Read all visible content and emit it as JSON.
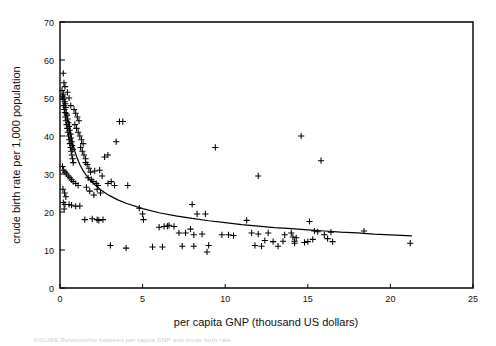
{
  "figure": {
    "caption_faint": "FIGURE  Relationship between per capita GNP and crude birth rate"
  },
  "chart_data": {
    "type": "scatter",
    "title": "",
    "xlabel": "per capita GNP (thousand US dollars)",
    "ylabel": "crude birth rate per 1,000 population",
    "xlim": [
      0,
      25
    ],
    "ylim": [
      0,
      70
    ],
    "xticks": [
      0,
      5,
      10,
      15,
      20,
      25
    ],
    "yticks": [
      0,
      10,
      20,
      30,
      40,
      50,
      60,
      70
    ],
    "xtick_labels": [
      "0",
      "5",
      "10",
      "15",
      "20",
      "25"
    ],
    "ytick_labels": [
      "0",
      "10",
      "20",
      "30",
      "40",
      "50",
      "60",
      "70"
    ],
    "grid": false,
    "legend": null,
    "marker": "plus",
    "marker_color": "#000000",
    "axis_color": "#000000",
    "series": [
      {
        "name": "countries",
        "marker": "+",
        "points": [
          [
            0.12,
            52.0
          ],
          [
            0.15,
            50.5
          ],
          [
            0.18,
            49.6
          ],
          [
            0.2,
            51.0
          ],
          [
            0.22,
            48.0
          ],
          [
            0.25,
            50.0
          ],
          [
            0.26,
            47.0
          ],
          [
            0.28,
            49.0
          ],
          [
            0.3,
            46.2
          ],
          [
            0.32,
            48.5
          ],
          [
            0.33,
            45.0
          ],
          [
            0.35,
            47.5
          ],
          [
            0.36,
            44.0
          ],
          [
            0.38,
            46.0
          ],
          [
            0.4,
            43.0
          ],
          [
            0.42,
            45.5
          ],
          [
            0.44,
            42.0
          ],
          [
            0.46,
            44.5
          ],
          [
            0.48,
            41.0
          ],
          [
            0.5,
            43.5
          ],
          [
            0.52,
            40.0
          ],
          [
            0.54,
            42.5
          ],
          [
            0.56,
            39.0
          ],
          [
            0.58,
            41.5
          ],
          [
            0.6,
            38.0
          ],
          [
            0.62,
            40.5
          ],
          [
            0.64,
            37.0
          ],
          [
            0.66,
            39.5
          ],
          [
            0.68,
            36.0
          ],
          [
            0.7,
            38.5
          ],
          [
            0.72,
            35.0
          ],
          [
            0.74,
            37.5
          ],
          [
            0.76,
            34.0
          ],
          [
            0.78,
            36.5
          ],
          [
            0.8,
            33.0
          ],
          [
            0.2,
            56.5
          ],
          [
            0.24,
            54.0
          ],
          [
            0.3,
            53.0
          ],
          [
            0.45,
            51.5
          ],
          [
            0.55,
            50.0
          ],
          [
            0.65,
            48.0
          ],
          [
            0.85,
            47.0
          ],
          [
            0.95,
            46.0
          ],
          [
            1.05,
            45.0
          ],
          [
            1.15,
            44.0
          ],
          [
            0.9,
            43.0
          ],
          [
            1.0,
            42.0
          ],
          [
            1.1,
            41.0
          ],
          [
            1.2,
            40.0
          ],
          [
            1.3,
            39.0
          ],
          [
            1.4,
            38.0
          ],
          [
            1.25,
            37.0
          ],
          [
            1.35,
            36.0
          ],
          [
            1.45,
            35.0
          ],
          [
            1.55,
            34.0
          ],
          [
            0.15,
            32.0
          ],
          [
            0.22,
            31.0
          ],
          [
            0.3,
            30.5
          ],
          [
            0.4,
            30.0
          ],
          [
            0.5,
            29.5
          ],
          [
            0.6,
            29.0
          ],
          [
            0.7,
            28.5
          ],
          [
            0.8,
            28.0
          ],
          [
            0.95,
            27.5
          ],
          [
            1.1,
            27.0
          ],
          [
            0.18,
            26.0
          ],
          [
            0.28,
            25.0
          ],
          [
            0.35,
            24.0
          ],
          [
            0.2,
            22.5
          ],
          [
            0.3,
            22.0
          ],
          [
            0.55,
            22.0
          ],
          [
            0.7,
            21.8
          ],
          [
            0.95,
            21.5
          ],
          [
            1.2,
            21.6
          ],
          [
            0.25,
            20.8
          ],
          [
            1.55,
            33.0
          ],
          [
            1.65,
            32.5
          ],
          [
            1.75,
            31.5
          ],
          [
            1.85,
            30.5
          ],
          [
            1.7,
            29.0
          ],
          [
            1.9,
            28.5
          ],
          [
            2.0,
            28.0
          ],
          [
            2.1,
            30.8
          ],
          [
            2.2,
            27.5
          ],
          [
            2.3,
            27.0
          ],
          [
            2.4,
            31.0
          ],
          [
            2.55,
            29.5
          ],
          [
            2.7,
            34.5
          ],
          [
            2.9,
            27.5
          ],
          [
            3.1,
            28.0
          ],
          [
            1.6,
            26.5
          ],
          [
            1.8,
            25.5
          ],
          [
            2.05,
            24.5
          ],
          [
            2.25,
            26.0
          ],
          [
            2.45,
            25.0
          ],
          [
            1.5,
            18.0
          ],
          [
            1.95,
            18.2
          ],
          [
            2.25,
            18.0
          ],
          [
            2.35,
            17.8
          ],
          [
            2.6,
            18.0
          ],
          [
            2.9,
            35.0
          ],
          [
            3.6,
            43.8
          ],
          [
            3.8,
            43.8
          ],
          [
            3.4,
            38.5
          ],
          [
            3.3,
            27.0
          ],
          [
            4.1,
            27.0
          ],
          [
            3.05,
            11.2
          ],
          [
            4.0,
            10.5
          ],
          [
            5.0,
            19.5
          ],
          [
            5.05,
            18.0
          ],
          [
            4.8,
            21.0
          ],
          [
            5.6,
            10.8
          ],
          [
            6.0,
            16.0
          ],
          [
            6.3,
            16.2
          ],
          [
            6.5,
            16.3
          ],
          [
            6.6,
            16.5
          ],
          [
            6.9,
            16.2
          ],
          [
            7.2,
            14.5
          ],
          [
            7.6,
            14.5
          ],
          [
            7.9,
            15.5
          ],
          [
            8.0,
            22.0
          ],
          [
            8.3,
            19.5
          ],
          [
            8.8,
            19.5
          ],
          [
            8.1,
            14.0
          ],
          [
            8.6,
            14.2
          ],
          [
            6.2,
            10.8
          ],
          [
            7.4,
            11.0
          ],
          [
            8.1,
            11.0
          ],
          [
            9.0,
            11.2
          ],
          [
            8.9,
            9.5
          ],
          [
            9.4,
            37.0
          ],
          [
            12.0,
            29.5
          ],
          [
            11.3,
            17.8
          ],
          [
            11.6,
            14.5
          ],
          [
            12.0,
            14.2
          ],
          [
            12.6,
            14.5
          ],
          [
            12.4,
            12.5
          ],
          [
            12.9,
            12.2
          ],
          [
            13.6,
            14.0
          ],
          [
            13.5,
            12.3
          ],
          [
            14.0,
            14.5
          ],
          [
            14.2,
            12.3
          ],
          [
            14.1,
            13.4
          ],
          [
            14.3,
            13.2
          ],
          [
            14.2,
            11.8
          ],
          [
            15.1,
            17.5
          ],
          [
            15.4,
            15.0
          ],
          [
            15.6,
            14.8
          ],
          [
            16.0,
            14.0
          ],
          [
            15.8,
            33.5
          ],
          [
            14.6,
            40.0
          ],
          [
            16.4,
            14.7
          ],
          [
            18.4,
            15.0
          ],
          [
            21.2,
            11.8
          ],
          [
            10.5,
            13.8
          ],
          [
            13.2,
            11.0
          ],
          [
            11.8,
            11.2
          ],
          [
            12.2,
            11.0
          ],
          [
            10.2,
            14.0
          ],
          [
            9.8,
            14.0
          ],
          [
            16.2,
            13.0
          ],
          [
            15.3,
            12.8
          ],
          [
            15.0,
            12.2
          ],
          [
            14.8,
            12.0
          ],
          [
            16.5,
            12.2
          ]
        ]
      }
    ],
    "fit_curve": {
      "name": "fitted power curve",
      "description": "decreasing curve from ~44 at low GNP to ~13.5 at GNP 21.3",
      "color": "#000000",
      "points": [
        [
          0.55,
          44.0
        ],
        [
          0.6,
          42.2
        ],
        [
          0.7,
          39.6
        ],
        [
          0.8,
          37.6
        ],
        [
          0.9,
          36.0
        ],
        [
          1.0,
          34.6
        ],
        [
          1.2,
          32.5
        ],
        [
          1.4,
          30.9
        ],
        [
          1.6,
          29.6
        ],
        [
          1.8,
          28.5
        ],
        [
          2.0,
          27.6
        ],
        [
          2.5,
          25.7
        ],
        [
          3.0,
          24.3
        ],
        [
          3.5,
          23.2
        ],
        [
          4.0,
          22.3
        ],
        [
          5.0,
          20.9
        ],
        [
          6.0,
          19.8
        ],
        [
          7.0,
          19.0
        ],
        [
          8.0,
          18.3
        ],
        [
          9.0,
          17.7
        ],
        [
          10.0,
          17.2
        ],
        [
          11.0,
          16.7
        ],
        [
          12.0,
          16.3
        ],
        [
          13.0,
          15.9
        ],
        [
          14.0,
          15.6
        ],
        [
          15.0,
          15.3
        ],
        [
          16.0,
          15.0
        ],
        [
          17.0,
          14.7
        ],
        [
          18.0,
          14.5
        ],
        [
          19.0,
          14.2
        ],
        [
          20.0,
          14.0
        ],
        [
          21.3,
          13.7
        ]
      ]
    }
  }
}
